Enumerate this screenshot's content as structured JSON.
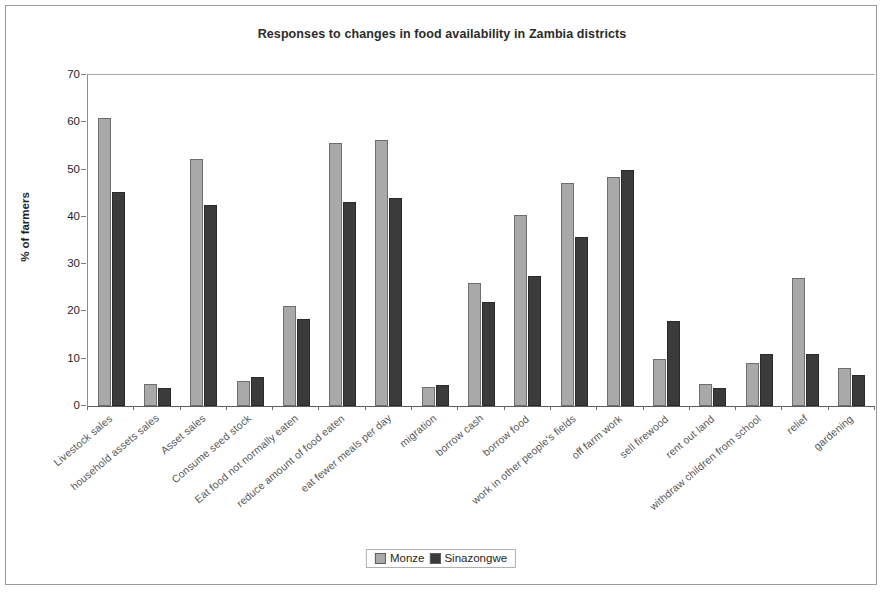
{
  "chart_data": {
    "type": "bar",
    "title": "Responses to changes in food availability in Zambia districts",
    "xlabel": "",
    "ylabel": "% of farmers",
    "ylim": [
      0,
      70
    ],
    "ytick_step": 10,
    "yticks": [
      "70",
      "60",
      "50",
      "40",
      "30",
      "20",
      "10",
      "0"
    ],
    "grid": false,
    "legend_position": "bottom-center",
    "categories": [
      "Livestock sales",
      "household assets sales",
      "Asset sales",
      "Consume seed stock",
      "Eat food not normally eaten",
      "reduce amount of food eaten",
      "eat fewer meals per day",
      "migration",
      "borrow cash",
      "borrow food",
      "work in other people's fields",
      "off farm work",
      "sell firewood",
      "rent out land",
      "withdraw children from school",
      "relief",
      "gardening"
    ],
    "series": [
      {
        "name": "Monze",
        "color": "#a9a9a9",
        "values": [
          61,
          4.7,
          52.3,
          5.3,
          21.2,
          55.7,
          56.3,
          4.1,
          26,
          40.5,
          47.2,
          48.5,
          10,
          4.6,
          9,
          27.1,
          8
        ]
      },
      {
        "name": "Sinazongwe",
        "color": "#3b3b3b",
        "values": [
          45.2,
          3.8,
          42.5,
          6.2,
          18.5,
          43.2,
          43.9,
          4.4,
          21.9,
          27.5,
          35.8,
          50,
          18,
          3.9,
          11,
          11,
          6.6
        ]
      }
    ]
  },
  "legend": {
    "entries": [
      {
        "label": "Monze",
        "swatch": "monze"
      },
      {
        "label": "Sinazongwe",
        "swatch": "sina"
      }
    ]
  },
  "colors": {
    "monze": "#a9a9a9",
    "sinazongwe": "#3b3b3b",
    "frame": "#9a9a9a",
    "axis": "#5d5d5d",
    "text": "#1f1f1f"
  }
}
